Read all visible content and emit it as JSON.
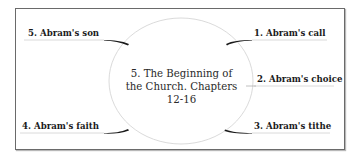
{
  "center": {
    "lines": [
      "5.  The Beginning of",
      "the Church. Chapters",
      "12-16"
    ]
  },
  "items": [
    {
      "id": "abrams-call",
      "label": "1.  Abram's call"
    },
    {
      "id": "abrams-choice",
      "label": "2.  Abram's choice"
    },
    {
      "id": "abrams-tithe",
      "label": "3.  Abram's tithe"
    },
    {
      "id": "abrams-faith",
      "label": "4.  Abram's faith"
    },
    {
      "id": "abrams-son",
      "label": "5.  Abram's son"
    }
  ],
  "colors": {
    "frame": "#6a6a6a",
    "ellipse": "#d8d8d8",
    "connector": "#1a1a1a",
    "underline": "#c8c8c8",
    "text": "#1a1a1a"
  }
}
